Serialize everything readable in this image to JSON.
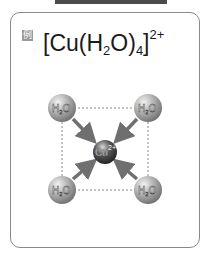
{
  "header": {
    "title_cut": ""
  },
  "card": {
    "example_marker": "例",
    "formula": {
      "open_bracket": "[Cu",
      "paren_open": "(H",
      "h_sub": "2",
      "o_close": "O)",
      "count_sub": "4",
      "close_bracket": "]",
      "charge": "2+"
    }
  },
  "diagram": {
    "center_ion": {
      "label": "Cu",
      "charge": "2+"
    },
    "ligands": [
      {
        "label": "H",
        "sub": "2",
        "tail": "O",
        "position": "top-left"
      },
      {
        "label": "H",
        "sub": "2",
        "tail": "O",
        "position": "top-right"
      },
      {
        "label": "H",
        "sub": "2",
        "tail": "O",
        "position": "bottom-left"
      },
      {
        "label": "H",
        "sub": "2",
        "tail": "O",
        "position": "bottom-right"
      }
    ],
    "colors": {
      "sphere": "#9e9e9e",
      "arrow": "#6f6f6f",
      "dashed": "#888888",
      "center": "#3a3a3a"
    }
  }
}
